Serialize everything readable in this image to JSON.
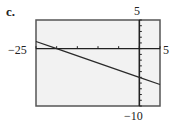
{
  "panel": {
    "label": "c."
  },
  "chart_data": {
    "type": "line",
    "title": "",
    "xlabel": "",
    "ylabel": "",
    "xlim": [
      -25,
      5
    ],
    "ylim": [
      -10,
      5
    ],
    "xscale": 5,
    "yscale": 1,
    "grid": false,
    "window_labels": {
      "xmin": "−25",
      "xmax": "5",
      "ymin": "−10",
      "ymax": "5"
    },
    "series": [
      {
        "name": "y = -0.25x - 5",
        "x": [
          -25,
          -20,
          0,
          5
        ],
        "y": [
          1.25,
          0,
          -5,
          -6.25
        ]
      }
    ]
  },
  "colors": {
    "frame": "#555555",
    "background": "#f2f2f2",
    "line": "#2a2a2a",
    "axis": "#222222"
  }
}
